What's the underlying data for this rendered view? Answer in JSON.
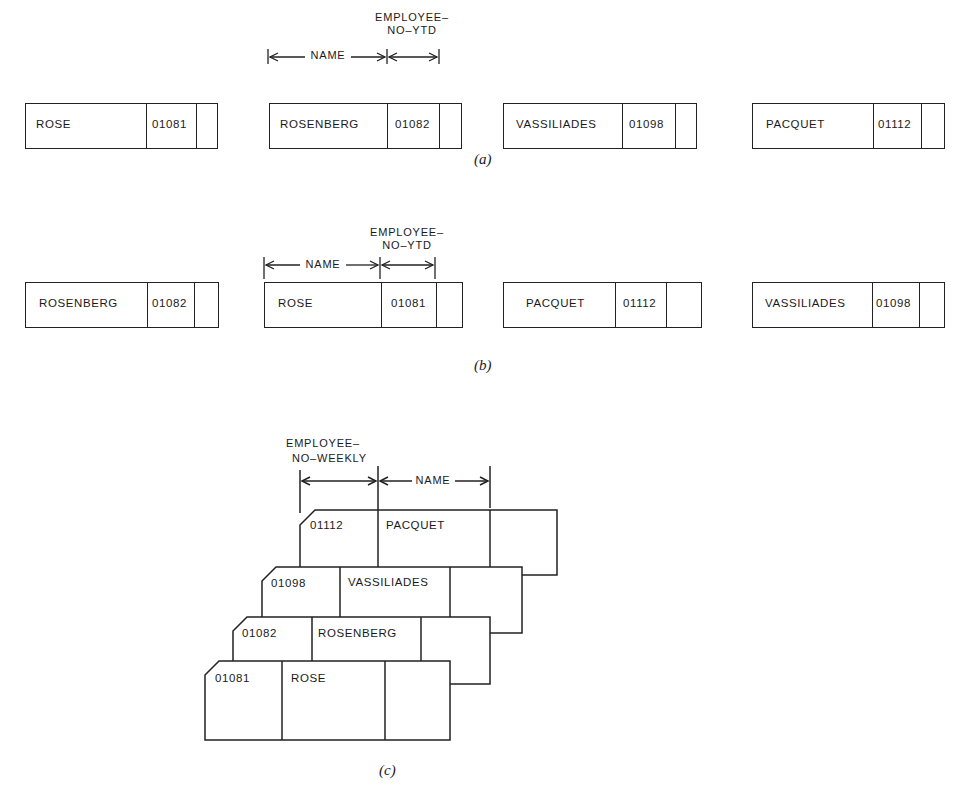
{
  "figure": {
    "panels": [
      {
        "caption": "(a)",
        "field_labels": {
          "name": "NAME",
          "emp_no_line1": "EMPLOYEE–",
          "emp_no_line2": "NO–YTD"
        },
        "records": [
          {
            "name": "ROSE",
            "employee_no": "01081"
          },
          {
            "name": "ROSENBERG",
            "employee_no": "01082"
          },
          {
            "name": "VASSILIADES",
            "employee_no": "01098"
          },
          {
            "name": "PACQUET",
            "employee_no": "01112"
          }
        ]
      },
      {
        "caption": "(b)",
        "field_labels": {
          "name": "NAME",
          "emp_no_line1": "EMPLOYEE–",
          "emp_no_line2": "NO–YTD"
        },
        "records": [
          {
            "name": "ROSENBERG",
            "employee_no": "01082"
          },
          {
            "name": "ROSE",
            "employee_no": "01081"
          },
          {
            "name": "PACQUET",
            "employee_no": "01112"
          },
          {
            "name": "VASSILIADES",
            "employee_no": "01098"
          }
        ]
      },
      {
        "caption": "(c)",
        "field_labels": {
          "name": "NAME",
          "emp_no_line1": "EMPLOYEE–",
          "emp_no_line2": "NO–WEEKLY"
        },
        "cards_back_to_front": [
          {
            "employee_no": "01112",
            "name": "PACQUET"
          },
          {
            "employee_no": "01098",
            "name": "VASSILIADES"
          },
          {
            "employee_no": "01082",
            "name": "ROSENBERG"
          },
          {
            "employee_no": "01081",
            "name": "ROSE"
          }
        ]
      }
    ]
  }
}
